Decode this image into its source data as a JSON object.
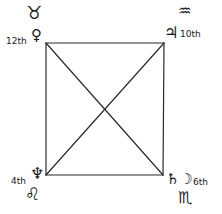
{
  "diagram": {
    "type": "astrological square chart",
    "corners": {
      "top_left": {
        "sign": "♉",
        "sign_name": "Taurus",
        "planet": "♀",
        "planet_name": "Venus",
        "house": "12th"
      },
      "top_right": {
        "sign": "♒",
        "sign_name": "Aquarius",
        "planet": "♃",
        "planet_name": "Jupiter",
        "house": "10th"
      },
      "bottom_left": {
        "sign": "♌",
        "sign_name": "Leo",
        "planet": "♆",
        "planet_name": "Neptune",
        "house": "4th"
      },
      "bottom_right": {
        "sign": "♏",
        "sign_name": "Scorpio",
        "planet": "♄☽",
        "planet_name": "Saturn and Moon",
        "house": "6th"
      }
    }
  }
}
